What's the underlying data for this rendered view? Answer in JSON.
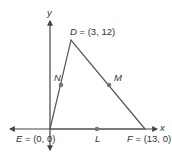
{
  "diagram": {
    "axes": {
      "x_label": "x",
      "y_label": "y"
    },
    "points": {
      "D": {
        "name": "D",
        "coords": "(3, 12)"
      },
      "E": {
        "name": "E",
        "coords": "(0, 0)"
      },
      "F": {
        "name": "F",
        "coords": "(13, 0)"
      },
      "N": {
        "name": "N"
      },
      "M": {
        "name": "M"
      },
      "L": {
        "name": "L"
      }
    },
    "text": {
      "D_eq": " = (3, 12)",
      "E_eq": " = (0, 0)",
      "F_eq": " = (13, 0)"
    },
    "colors": {
      "line": "#555555",
      "point": "#777777",
      "axis": "#444444"
    }
  }
}
